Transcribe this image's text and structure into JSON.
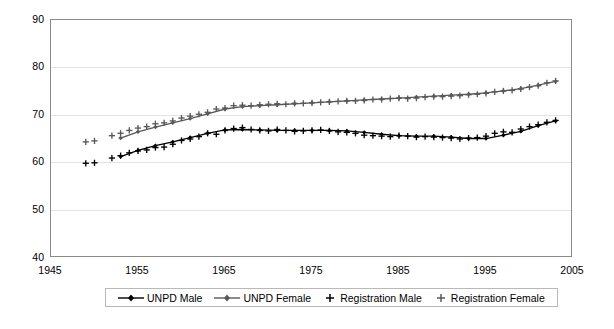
{
  "chart_data": {
    "type": "line",
    "title": "",
    "subtitle": "",
    "xlabel": "",
    "ylabel": "",
    "xlim": [
      1945,
      2005
    ],
    "ylim": [
      40,
      90
    ],
    "xticks": [
      1945,
      1955,
      1965,
      1975,
      1985,
      1995,
      2005
    ],
    "yticks": [
      40,
      50,
      60,
      70,
      80,
      90
    ],
    "grid": true,
    "legend_position": "bottom",
    "colors": {
      "unpd_male": "#000000",
      "unpd_female": "#595959",
      "registration_male": "#000000",
      "registration_female": "#595959",
      "gridline": "#e3e3e3",
      "axis": "#8a8a8a",
      "background": "#ffffff"
    },
    "series": [
      {
        "name": "UNPD Male",
        "marker": "diamond",
        "style": "line",
        "x": [
          1953,
          1955,
          1957,
          1959,
          1961,
          1963,
          1965,
          1967,
          1969,
          1971,
          1973,
          1975,
          1977,
          1979,
          1981,
          1983,
          1985,
          1987,
          1989,
          1991,
          1993,
          1995,
          1997,
          1999,
          2001,
          2003
        ],
        "values": [
          61.3,
          62.6,
          63.6,
          64.4,
          65.3,
          66.2,
          66.9,
          67.0,
          66.9,
          66.8,
          66.8,
          66.8,
          66.8,
          66.7,
          66.4,
          66.0,
          65.7,
          65.6,
          65.6,
          65.4,
          65.1,
          65.1,
          65.8,
          66.6,
          67.8,
          68.8
        ]
      },
      {
        "name": "UNPD Female",
        "marker": "diamond",
        "style": "line",
        "x": [
          1953,
          1955,
          1957,
          1959,
          1961,
          1963,
          1965,
          1967,
          1969,
          1971,
          1973,
          1975,
          1977,
          1979,
          1981,
          1983,
          1985,
          1987,
          1989,
          1991,
          1993,
          1995,
          1997,
          1999,
          2001,
          2003
        ],
        "values": [
          65.2,
          66.5,
          67.5,
          68.4,
          69.3,
          70.3,
          71.3,
          71.8,
          72.0,
          72.2,
          72.4,
          72.6,
          72.8,
          73.0,
          73.2,
          73.4,
          73.6,
          73.8,
          74.0,
          74.2,
          74.4,
          74.7,
          75.1,
          75.6,
          76.3,
          77.1
        ]
      },
      {
        "name": "Registration Male",
        "marker": "plus",
        "style": "points",
        "x": [
          1949,
          1950,
          1952,
          1953,
          1954,
          1955,
          1956,
          1957,
          1958,
          1959,
          1960,
          1961,
          1962,
          1963,
          1964,
          1965,
          1966,
          1967,
          1968,
          1969,
          1970,
          1971,
          1972,
          1973,
          1974,
          1975,
          1976,
          1977,
          1978,
          1979,
          1980,
          1981,
          1982,
          1983,
          1984,
          1985,
          1986,
          1987,
          1988,
          1989,
          1990,
          1991,
          1992,
          1993,
          1994,
          1995,
          1996,
          1997,
          1998,
          1999,
          2000,
          2001,
          2002,
          2003
        ],
        "values": [
          59.9,
          60.0,
          61.0,
          61.5,
          62.1,
          62.5,
          62.7,
          63.2,
          63.3,
          63.9,
          64.7,
          65.0,
          65.5,
          66.2,
          66.0,
          66.8,
          67.2,
          67.4,
          67.0,
          66.8,
          66.7,
          67.0,
          66.8,
          66.6,
          66.7,
          66.8,
          66.9,
          66.7,
          66.5,
          66.4,
          66.2,
          65.8,
          65.7,
          65.6,
          65.5,
          65.7,
          65.6,
          65.4,
          65.5,
          65.4,
          65.3,
          65.2,
          65.0,
          65.2,
          65.3,
          65.6,
          66.2,
          66.5,
          66.4,
          67.1,
          67.6,
          68.0,
          68.5,
          68.9
        ]
      },
      {
        "name": "Registration Female",
        "marker": "plus",
        "style": "points",
        "x": [
          1949,
          1950,
          1952,
          1953,
          1954,
          1955,
          1956,
          1957,
          1958,
          1959,
          1960,
          1961,
          1962,
          1963,
          1964,
          1965,
          1966,
          1967,
          1968,
          1969,
          1970,
          1971,
          1972,
          1973,
          1974,
          1975,
          1976,
          1977,
          1978,
          1979,
          1980,
          1981,
          1982,
          1983,
          1984,
          1985,
          1986,
          1987,
          1988,
          1989,
          1990,
          1991,
          1992,
          1993,
          1994,
          1995,
          1996,
          1997,
          1998,
          1999,
          2000,
          2001,
          2002,
          2003
        ],
        "values": [
          64.4,
          64.6,
          65.7,
          66.2,
          66.8,
          67.3,
          67.6,
          68.2,
          68.4,
          68.8,
          69.4,
          69.8,
          70.2,
          70.6,
          71.3,
          71.5,
          72.0,
          72.1,
          72.0,
          72.2,
          72.3,
          72.4,
          72.3,
          72.5,
          72.5,
          72.6,
          72.7,
          72.8,
          72.9,
          73.0,
          73.0,
          73.1,
          73.3,
          73.3,
          73.5,
          73.6,
          73.5,
          73.6,
          73.8,
          73.9,
          73.9,
          74.0,
          74.1,
          74.3,
          74.4,
          74.6,
          74.9,
          75.1,
          75.2,
          75.5,
          75.9,
          76.2,
          76.8,
          77.2
        ]
      }
    ]
  },
  "axes": {
    "y_tick_labels": [
      "90",
      "80",
      "70",
      "60",
      "50",
      "40"
    ],
    "x_tick_labels": [
      "1945",
      "1955",
      "1965",
      "1975",
      "1985",
      "1995",
      "2005"
    ]
  },
  "legend": {
    "items": [
      {
        "label": "UNPD Male",
        "marker": "line-diamond",
        "color": "#000000"
      },
      {
        "label": "UNPD Female",
        "marker": "line-diamond",
        "color": "#595959"
      },
      {
        "label": "Registration Male",
        "marker": "plus",
        "color": "#000000"
      },
      {
        "label": "Registration Female",
        "marker": "plus",
        "color": "#595959"
      }
    ]
  }
}
